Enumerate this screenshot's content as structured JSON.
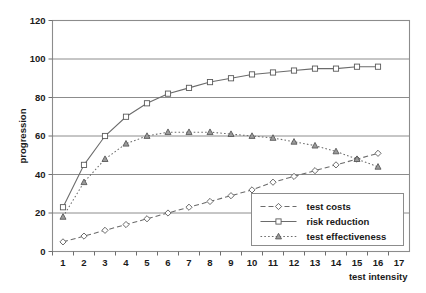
{
  "chart_data": {
    "type": "line",
    "title": "",
    "xlabel": "test intensity",
    "ylabel": "progression",
    "x": [
      1,
      2,
      3,
      4,
      5,
      6,
      7,
      8,
      9,
      10,
      11,
      12,
      13,
      14,
      15,
      16,
      17
    ],
    "xlim": [
      0.5,
      17.5
    ],
    "ylim": [
      0,
      120
    ],
    "yticks": [
      0,
      20,
      40,
      60,
      80,
      100,
      120
    ],
    "xticks": [
      1,
      2,
      3,
      4,
      5,
      6,
      7,
      8,
      9,
      10,
      11,
      12,
      13,
      14,
      15,
      16,
      17
    ],
    "grid": "horizontal",
    "legend_position": "bottom-right",
    "series": [
      {
        "name": "test costs",
        "marker": "open-diamond",
        "line_style": "dashed",
        "x": [
          1,
          2,
          3,
          4,
          5,
          6,
          7,
          8,
          9,
          10,
          11,
          12,
          13,
          14,
          15,
          16
        ],
        "values": [
          5,
          8,
          11,
          14,
          17,
          20,
          23,
          26,
          29,
          32,
          36,
          39,
          42,
          45,
          48,
          51
        ]
      },
      {
        "name": "risk reduction",
        "marker": "open-square",
        "line_style": "solid",
        "x": [
          1,
          2,
          3,
          4,
          5,
          6,
          7,
          8,
          9,
          10,
          11,
          12,
          13,
          14,
          15,
          16
        ],
        "values": [
          23,
          45,
          60,
          70,
          77,
          82,
          85,
          88,
          90,
          92,
          93,
          94,
          95,
          95,
          96,
          96
        ]
      },
      {
        "name": "test effectiveness",
        "marker": "filled-triangle",
        "line_style": "dotted",
        "x": [
          1,
          2,
          3,
          4,
          5,
          6,
          7,
          8,
          9,
          10,
          11,
          12,
          13,
          14,
          15,
          16
        ],
        "values": [
          18,
          36,
          48,
          56,
          60,
          62,
          62,
          62,
          61,
          60,
          59,
          57,
          55,
          52,
          48,
          44
        ]
      }
    ]
  },
  "legend": {
    "items": [
      {
        "label": "test costs"
      },
      {
        "label": "risk reduction"
      },
      {
        "label": "test effectiveness"
      }
    ]
  },
  "colors": {
    "line": "#6b6b6b",
    "grid": "#8c8c8c",
    "text": "#1a1a1a",
    "background": "#ffffff"
  }
}
